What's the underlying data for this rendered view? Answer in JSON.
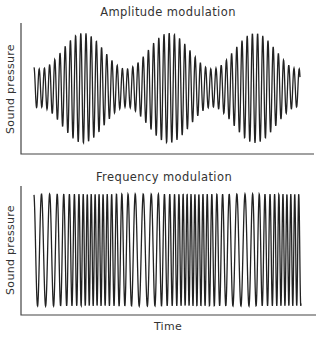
{
  "chart_data": [
    {
      "type": "line",
      "title": "Amplitude modulation",
      "xlabel": "",
      "ylabel": "Sound pressure",
      "grid": false,
      "legend": "none",
      "series": [
        {
          "name": "AM signal",
          "description": "Sinusoidal carrier whose amplitude varies sinusoidally; three envelope maxima across the time span",
          "carrier_cycles_per_envelope_period": 16.5,
          "envelope_periods_visible": 3.1,
          "envelope_min_relative": 0.35,
          "envelope_max_relative": 1.0
        }
      ]
    },
    {
      "type": "line",
      "title": "Frequency modulation",
      "xlabel": "Time",
      "ylabel": "Sound pressure",
      "grid": false,
      "legend": "none",
      "series": [
        {
          "name": "FM signal",
          "description": "Constant-amplitude carrier whose frequency varies sinusoidally; alternating sparse and dense regions",
          "frequency_ratio_max_to_min": 2.0,
          "modulation_periods_visible": 2.8,
          "amplitude_relative": 1.0
        }
      ]
    }
  ],
  "am": {
    "title": "Amplitude modulation",
    "ylabel": "Sound pressure"
  },
  "fm": {
    "title": "Frequency modulation",
    "ylabel": "Sound pressure",
    "xlabel": "Time"
  },
  "render": {
    "am": {
      "x0": 34,
      "x1": 300,
      "cy": 88,
      "amin": 19,
      "amax": 55,
      "envPeriod": 86,
      "envPeakX": 83,
      "carrierPeriod": 5.2
    },
    "fm": {
      "x0": 34,
      "x1": 301,
      "cy": 250,
      "amp": 56,
      "modPeriod": 98,
      "sparseX": 45,
      "pMin": 3.9,
      "pMax": 8.2
    }
  }
}
